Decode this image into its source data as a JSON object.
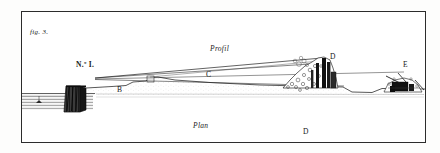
{
  "plate": {
    "figure_label": "fig. 3.",
    "station_label": "N.º I.",
    "section_label": "Profil",
    "plan_label": "Plan",
    "ink_color": "#1a1a1a",
    "paper_color": "#fdfdfc",
    "frame_color": "#2c2c2c"
  },
  "points": [
    {
      "id": "b",
      "label": "B"
    },
    {
      "id": "c",
      "label": "C"
    },
    {
      "id": "d",
      "label": "D"
    },
    {
      "id": "e",
      "label": "E"
    },
    {
      "id": "d2",
      "label": "D"
    }
  ]
}
